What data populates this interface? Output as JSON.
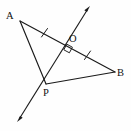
{
  "figure": {
    "type": "geometry-diagram",
    "background_color": "#fefefe",
    "stroke_color": "#1a1a1a",
    "canvas": {
      "width": 131,
      "height": 131
    }
  },
  "labels": {
    "a": "A",
    "b": "B",
    "p": "P",
    "o": "O"
  },
  "points": {
    "A": {
      "x": 20,
      "y": 21
    },
    "B": {
      "x": 115,
      "y": 72
    },
    "P": {
      "x": 46,
      "y": 84
    },
    "O": {
      "x": 66,
      "y": 47
    }
  },
  "segments": [
    {
      "name": "AB",
      "from": "A",
      "to": "B",
      "ticks": 0
    },
    {
      "name": "AP",
      "from": "A",
      "to": "P",
      "ticks": 0
    },
    {
      "name": "PB",
      "from": "P",
      "to": "B",
      "ticks": 0
    },
    {
      "name": "AO",
      "from": "A",
      "to": "O",
      "ticks": 1
    },
    {
      "name": "OB",
      "from": "O",
      "to": "B",
      "ticks": 1
    }
  ],
  "ray": {
    "name": "line-through-P-and-O",
    "double_headed": true,
    "tip_upper": {
      "x": 90,
      "y": 6
    },
    "tip_lower": {
      "x": 17,
      "y": 122
    },
    "passes_through": [
      "P",
      "O"
    ]
  },
  "marks": {
    "right_angle_at": "O",
    "right_angle_size": 7,
    "congruent_tick_segments": [
      "AO",
      "OB"
    ]
  }
}
